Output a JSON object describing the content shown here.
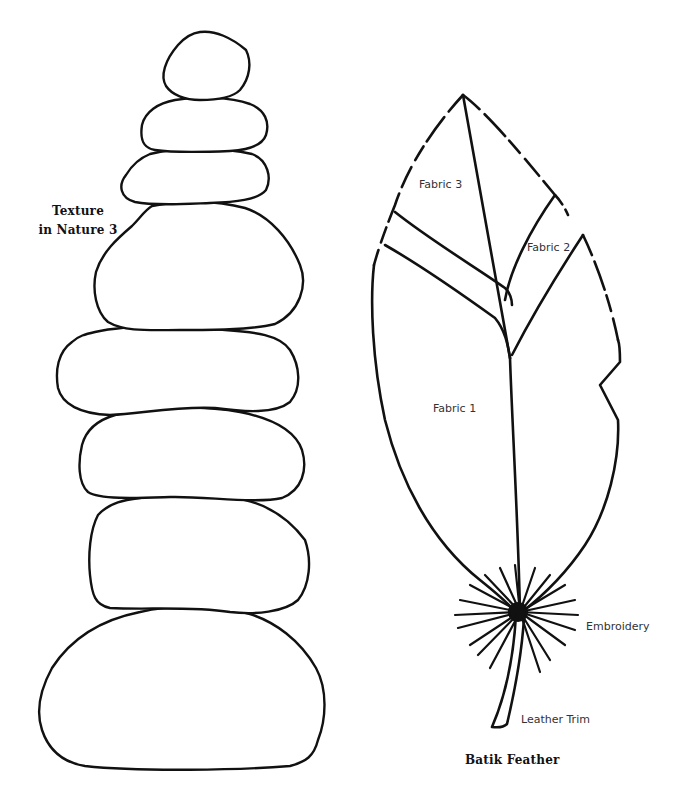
{
  "left_panel": {
    "title_line1": "Texture",
    "title_line2": "in Nature 3",
    "stone_count": 8
  },
  "right_panel": {
    "title": "Batik Feather",
    "labels": {
      "fabric_3": "Fabric 3",
      "fabric_2": "Fabric 2",
      "fabric_1": "Fabric 1",
      "embroidery": "Embroidery",
      "leather_trim": "Leather Trim"
    }
  },
  "colors": {
    "outline": "#111111",
    "background": "#ffffff",
    "label_text": "#333333"
  }
}
